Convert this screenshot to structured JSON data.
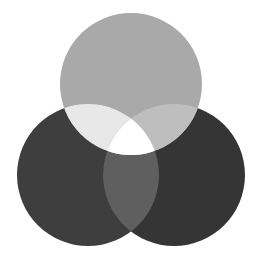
{
  "diagram": {
    "type": "venn-3",
    "background": "#ffffff",
    "width": 254,
    "height": 266,
    "circles": [
      {
        "id": "top",
        "cx": 131,
        "cy": 84,
        "r": 71
      },
      {
        "id": "left",
        "cx": 88,
        "cy": 175,
        "r": 71
      },
      {
        "id": "right",
        "cx": 174,
        "cy": 175,
        "r": 71
      }
    ],
    "regions": {
      "top_only": "#a9a9a9",
      "left_only": "#3e3e3e",
      "right_only": "#353535",
      "top_left": "#e7e7e7",
      "top_right": "#bebebe",
      "left_right": "#5f5f5f",
      "all_three": "#ffffff"
    }
  }
}
